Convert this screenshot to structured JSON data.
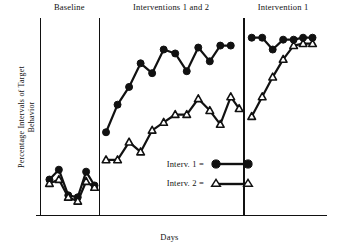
{
  "chart_data": {
    "type": "line",
    "title": "",
    "xlabel": "Days",
    "ylabel": "Percentage Intervals of Target\nBehavior",
    "ylim": [
      0,
      100
    ],
    "xlim": [
      0,
      27
    ],
    "grid": false,
    "axis_ticks": "none",
    "legend_position": "inside-center",
    "design": "single-subject multiple-treatment (A-BC-B) design",
    "phases": [
      {
        "name": "Baseline",
        "label": "Baseline",
        "x_start": 0,
        "x_end": 5.6
      },
      {
        "name": "Interventions 1 and 2",
        "label": "Interventions 1 and 2",
        "x_start": 5.6,
        "x_end": 19.4
      },
      {
        "name": "Intervention 1",
        "label": "Intervention 1",
        "x_start": 19.4,
        "x_end": 27
      }
    ],
    "series": [
      {
        "name": "Interv. 1",
        "marker": "filled-circle",
        "color": "#111111",
        "points": [
          {
            "x": 0.9,
            "y": 18
          },
          {
            "x": 1.8,
            "y": 23
          },
          {
            "x": 2.7,
            "y": 10
          },
          {
            "x": 3.6,
            "y": 9
          },
          {
            "x": 4.4,
            "y": 22
          },
          {
            "x": 5.2,
            "y": 15
          },
          {
            "x": 6.3,
            "y": 42
          },
          {
            "x": 7.4,
            "y": 56
          },
          {
            "x": 8.5,
            "y": 65
          },
          {
            "x": 9.6,
            "y": 77
          },
          {
            "x": 10.7,
            "y": 72
          },
          {
            "x": 11.8,
            "y": 84
          },
          {
            "x": 12.9,
            "y": 82
          },
          {
            "x": 14.0,
            "y": 73
          },
          {
            "x": 15.1,
            "y": 85
          },
          {
            "x": 16.2,
            "y": 78
          },
          {
            "x": 17.2,
            "y": 86
          },
          {
            "x": 18.2,
            "y": 86
          },
          {
            "x": 20.2,
            "y": 90
          },
          {
            "x": 21.2,
            "y": 90
          },
          {
            "x": 22.2,
            "y": 84
          },
          {
            "x": 23.2,
            "y": 89
          },
          {
            "x": 24.2,
            "y": 89
          },
          {
            "x": 25.1,
            "y": 90
          },
          {
            "x": 26.0,
            "y": 90
          }
        ]
      },
      {
        "name": "Interv. 2",
        "marker": "open-triangle",
        "color": "#111111",
        "points": [
          {
            "x": 0.9,
            "y": 16
          },
          {
            "x": 1.8,
            "y": 18
          },
          {
            "x": 2.7,
            "y": 9
          },
          {
            "x": 3.6,
            "y": 7
          },
          {
            "x": 4.4,
            "y": 17
          },
          {
            "x": 5.2,
            "y": 14
          },
          {
            "x": 6.3,
            "y": 28
          },
          {
            "x": 7.4,
            "y": 28
          },
          {
            "x": 8.5,
            "y": 37
          },
          {
            "x": 9.6,
            "y": 32
          },
          {
            "x": 10.7,
            "y": 43
          },
          {
            "x": 11.8,
            "y": 47
          },
          {
            "x": 12.9,
            "y": 51
          },
          {
            "x": 14.0,
            "y": 51
          },
          {
            "x": 15.1,
            "y": 59
          },
          {
            "x": 16.2,
            "y": 53
          },
          {
            "x": 17.2,
            "y": 46
          },
          {
            "x": 18.2,
            "y": 60
          },
          {
            "x": 19.0,
            "y": 54
          },
          {
            "x": 20.2,
            "y": 50
          },
          {
            "x": 21.2,
            "y": 60
          },
          {
            "x": 22.2,
            "y": 70
          },
          {
            "x": 23.2,
            "y": 79
          },
          {
            "x": 24.2,
            "y": 86
          },
          {
            "x": 25.1,
            "y": 87
          },
          {
            "x": 26.0,
            "y": 87
          }
        ]
      }
    ],
    "legend": [
      {
        "label": "Interv. 1 =",
        "marker": "filled-circle"
      },
      {
        "label": "Interv. 2 =",
        "marker": "open-triangle"
      }
    ]
  }
}
